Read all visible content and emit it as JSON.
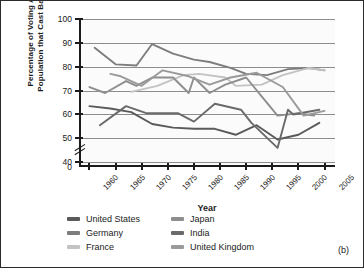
{
  "figure": {
    "panel_label": "(b)"
  },
  "chart_data": {
    "type": "line",
    "title": "",
    "xlabel": "Year",
    "ylabel": "Percentage of Voting Age Population that Cast Ballots",
    "ylabel_line1": "Percentage of Voting Age",
    "ylabel_line2": "Population that Cast Ballots",
    "x": [
      1960,
      1965,
      1970,
      1975,
      1980,
      1985,
      1990,
      1995,
      2000,
      2005
    ],
    "categories": [
      "1960",
      "1965",
      "1970",
      "1975",
      "1980",
      "1985",
      "1990",
      "1995",
      "2000",
      "2005"
    ],
    "xlim": [
      1958,
      2007
    ],
    "ylim": [
      38,
      100
    ],
    "yticks": [
      0,
      40,
      50,
      60,
      70,
      80,
      90,
      100
    ],
    "ytick_labels": [
      "0",
      "40",
      "50",
      "60",
      "70",
      "80",
      "90",
      "100"
    ],
    "axis_break": true,
    "grid": "horizontal",
    "legend_position": "below",
    "series": [
      {
        "name": "United States",
        "color": "#5a5a5a",
        "points": [
          [
            1960,
            63.5
          ],
          [
            1964,
            62.5
          ],
          [
            1968,
            61.0
          ],
          [
            1972,
            56.0
          ],
          [
            1976,
            54.5
          ],
          [
            1980,
            54.0
          ],
          [
            1984,
            54.0
          ],
          [
            1988,
            51.5
          ],
          [
            1992,
            55.5
          ],
          [
            1996,
            49.5
          ],
          [
            2000,
            51.5
          ],
          [
            2004,
            56.5
          ]
        ]
      },
      {
        "name": "Germany",
        "color": "#7d7d7d",
        "points": [
          [
            1961,
            88.0
          ],
          [
            1965,
            81.0
          ],
          [
            1969,
            80.5
          ],
          [
            1972,
            89.5
          ],
          [
            1976,
            85.5
          ],
          [
            1980,
            83.0
          ],
          [
            1983,
            82.0
          ],
          [
            1987,
            79.5
          ],
          [
            1990,
            77.0
          ],
          [
            1994,
            76.5
          ],
          [
            1998,
            79.0
          ],
          [
            2002,
            79.5
          ],
          [
            2005,
            78.5
          ]
        ]
      },
      {
        "name": "France",
        "color": "#c3c3c3",
        "points": [
          [
            1968,
            69.5
          ],
          [
            1973,
            72.0
          ],
          [
            1978,
            76.5
          ],
          [
            1981,
            77.0
          ],
          [
            1986,
            75.5
          ],
          [
            1988,
            72.0
          ],
          [
            1993,
            72.5
          ],
          [
            1997,
            76.5
          ],
          [
            2002,
            79.5
          ],
          [
            2005,
            78.5
          ]
        ]
      },
      {
        "name": "Japan",
        "color": "#8e8e8e",
        "points": [
          [
            1960,
            71.5
          ],
          [
            1963,
            69.0
          ],
          [
            1967,
            74.0
          ],
          [
            1969,
            72.0
          ],
          [
            1972,
            75.5
          ],
          [
            1976,
            75.5
          ],
          [
            1979,
            69.0
          ],
          [
            1980,
            75.5
          ],
          [
            1983,
            69.0
          ],
          [
            1986,
            72.5
          ],
          [
            1990,
            75.5
          ],
          [
            1993,
            67.5
          ],
          [
            1996,
            59.5
          ],
          [
            2000,
            60.5
          ],
          [
            2003,
            59.5
          ]
        ]
      },
      {
        "name": "India",
        "color": "#6a6a6a",
        "points": [
          [
            1962,
            55.5
          ],
          [
            1967,
            63.5
          ],
          [
            1971,
            60.5
          ],
          [
            1977,
            60.5
          ],
          [
            1980,
            57.0
          ],
          [
            1984,
            64.5
          ],
          [
            1989,
            62.0
          ],
          [
            1991,
            56.5
          ],
          [
            1996,
            46.0
          ],
          [
            1998,
            62.0
          ],
          [
            1999,
            60.0
          ],
          [
            2004,
            62.0
          ]
        ]
      },
      {
        "name": "United Kingdom",
        "color": "#9a9a9a",
        "points": [
          [
            1964,
            77.0
          ],
          [
            1966,
            76.0
          ],
          [
            1970,
            72.0
          ],
          [
            1974,
            78.5
          ],
          [
            1979,
            76.0
          ],
          [
            1983,
            72.5
          ],
          [
            1987,
            75.5
          ],
          [
            1992,
            77.5
          ],
          [
            1997,
            71.5
          ],
          [
            2001,
            59.5
          ],
          [
            2005,
            61.5
          ]
        ]
      }
    ]
  },
  "legend": {
    "column1": [
      {
        "label": "United States",
        "color": "#5a5a5a"
      },
      {
        "label": "Germany",
        "color": "#7d7d7d"
      },
      {
        "label": "France",
        "color": "#c3c3c3"
      }
    ],
    "column2": [
      {
        "label": "Japan",
        "color": "#8e8e8e"
      },
      {
        "label": "India",
        "color": "#6a6a6a"
      },
      {
        "label": "United Kingdom",
        "color": "#9a9a9a"
      }
    ]
  }
}
